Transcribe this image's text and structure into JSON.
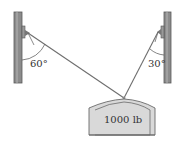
{
  "diagram": {
    "left_angle": "60°",
    "right_angle": "30°",
    "weight_label": "1000 lb",
    "colors": {
      "pole": "#8c8c8c",
      "pole_edge": "#5a5a5a",
      "cable": "#6e6e6e",
      "block_fill": "#d9d9d9",
      "block_edge": "#6a6a6a"
    }
  }
}
